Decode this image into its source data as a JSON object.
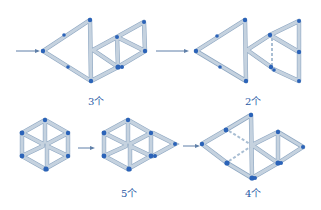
{
  "diagram": {
    "colors": {
      "stick": "#c5d2df",
      "stick_edge": "#8ea7c2",
      "node": "#2b63b8",
      "label": "#2a5aa6",
      "arrow": "#5f7fa8"
    },
    "labels": {
      "fig1": "3个",
      "fig2": "2个",
      "fig3": "5个",
      "fig4": "4个"
    },
    "figures": [
      {
        "id": "arrow-fish-3",
        "label_key": "fig1"
      },
      {
        "id": "arrow-fish-2",
        "label_key": "fig2"
      },
      {
        "id": "hexagon-start",
        "label_key": null
      },
      {
        "id": "hexagon-5",
        "label_key": "fig3"
      },
      {
        "id": "shape-4",
        "label_key": "fig4"
      }
    ]
  }
}
